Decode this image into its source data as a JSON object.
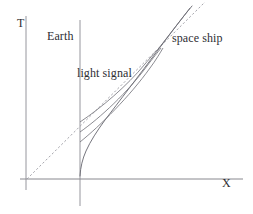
{
  "figure": {
    "kind": "minkowski-spacetime-diagram",
    "background_color": "#ffffff",
    "ink_color": "#6e6e76",
    "text_color": "#2e2e33",
    "width": 253,
    "height": 214
  },
  "axes": {
    "vertical": {
      "label": "T",
      "x": 26,
      "y_top": 16,
      "y_bottom": 190,
      "color": "#8a8a92"
    },
    "horizontal": {
      "label": "X",
      "y": 179,
      "x_left": 20,
      "x_right": 243,
      "color": "#7a7a82"
    }
  },
  "worldlines": {
    "earth": {
      "label": "Earth",
      "style": "solid-vertical",
      "x": 80,
      "y_top": 20,
      "y_bottom": 206,
      "color": "#8a8a92"
    },
    "light_cone": {
      "label": "light signal",
      "style": "dashed",
      "from": [
        27,
        179
      ],
      "to": [
        205,
        2
      ],
      "color": "#9b9ba3"
    },
    "space_ship": {
      "label": "space ship",
      "style": "solid-curve",
      "description": "hyperbolic worldline leaving the Earth line and asymptoting to the light cone",
      "start": [
        80,
        176
      ],
      "end": [
        192,
        6
      ],
      "color": "#6e6e76"
    },
    "light_signals": [
      {
        "name": "light-signal-1",
        "from": [
          80,
          142
        ],
        "to": [
          166,
          48
        ],
        "color": "#6e6e76"
      },
      {
        "name": "light-signal-2",
        "from": [
          80,
          132
        ],
        "to": [
          163,
          48
        ],
        "color": "#6e6e76"
      },
      {
        "name": "light-signal-3",
        "from": [
          80,
          122
        ],
        "to": [
          160,
          48
        ],
        "color": "#6e6e76"
      }
    ]
  },
  "labels": {
    "t_axis": "T",
    "x_axis": "X",
    "earth": "Earth",
    "light_signal": "light signal",
    "space_ship": "space ship"
  }
}
